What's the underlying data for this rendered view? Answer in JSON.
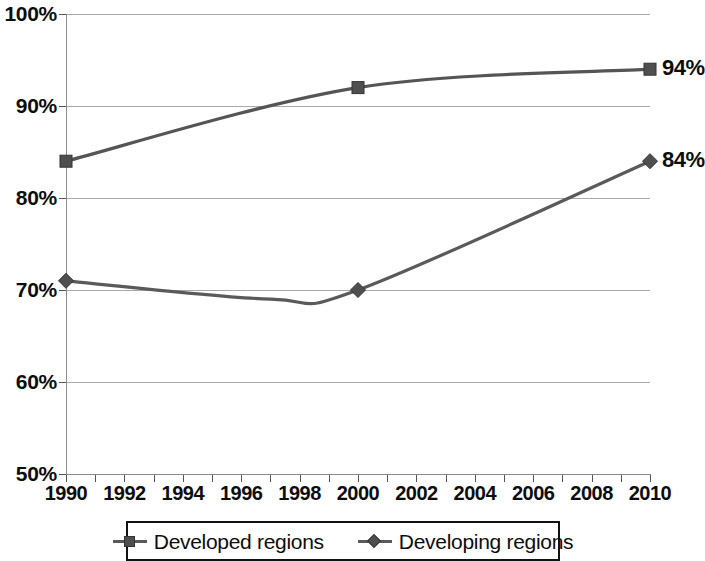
{
  "chart_data": {
    "type": "line",
    "title": "",
    "subtitle": "",
    "xlabel": "",
    "ylabel": "",
    "xlim": [
      1990,
      2010
    ],
    "ylim": [
      50,
      100
    ],
    "ytick_labels": [
      "100%",
      "90%",
      "80%",
      "70%",
      "60%",
      "50%"
    ],
    "ytick_values": [
      100,
      90,
      80,
      70,
      60,
      50
    ],
    "xtick_labels": [
      "1990",
      "1992",
      "1994",
      "1996",
      "1998",
      "2000",
      "2002",
      "2004",
      "2006",
      "2008",
      "2010"
    ],
    "xtick_values": [
      1990,
      1992,
      1994,
      1996,
      1998,
      2000,
      2002,
      2004,
      2006,
      2008,
      2010
    ],
    "grid": true,
    "grid_axis": "y",
    "legend_position": "bottom",
    "value_unit": "%",
    "series": [
      {
        "name": "Developed regions",
        "marker": "square",
        "color": "#555555",
        "marker_color": "#4f4f4f",
        "x": [
          1990,
          2000,
          2010
        ],
        "values": [
          84,
          92,
          94
        ],
        "end_label": "94%"
      },
      {
        "name": "Developing regions",
        "marker": "diamond",
        "color": "#5a5a5a",
        "marker_color": "#4f4f4f",
        "x": [
          1990,
          2000,
          2010
        ],
        "values": [
          71,
          70,
          84
        ],
        "curve_min": 69,
        "curve_min_year": 1997,
        "end_label": "84%"
      }
    ]
  },
  "legend": {
    "entries": [
      {
        "label": "Developed regions",
        "marker": "square"
      },
      {
        "label": "Developing regions",
        "marker": "diamond"
      }
    ]
  },
  "colors": {
    "series_line": "#555555",
    "marker_fill": "#4f4f4f",
    "gridline": "#a8a8a8",
    "axis": "#8a8a8a",
    "text": "#0d0d0d",
    "background": "#ffffff"
  }
}
